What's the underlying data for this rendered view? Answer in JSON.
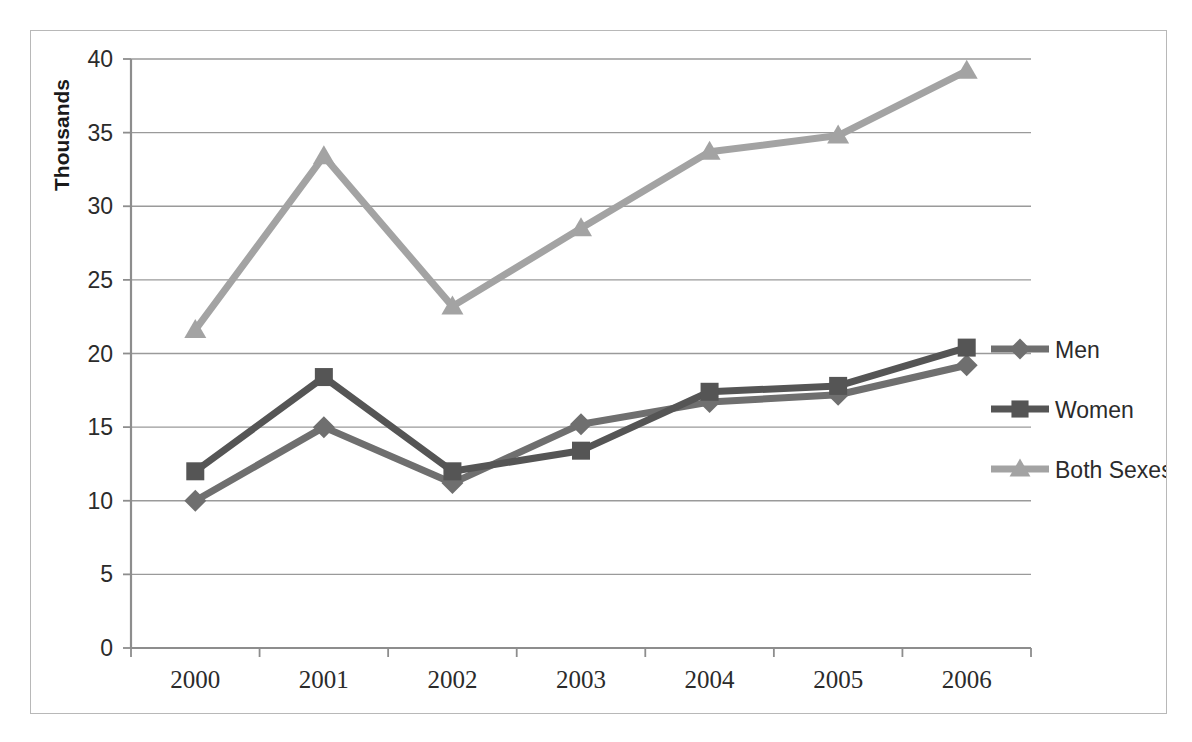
{
  "chart_data": {
    "type": "line",
    "title": "",
    "xlabel": "",
    "ylabel": "Thousands",
    "categories": [
      "2000",
      "2001",
      "2002",
      "2003",
      "2004",
      "2005",
      "2006"
    ],
    "x": [
      2000,
      2001,
      2002,
      2003,
      2004,
      2005,
      2006
    ],
    "series": [
      {
        "name": "Men",
        "marker": "diamond",
        "color": "#6f6f6f",
        "values": [
          10.0,
          15.0,
          11.2,
          15.2,
          16.7,
          17.2,
          19.2
        ]
      },
      {
        "name": "Women",
        "marker": "square",
        "color": "#555555",
        "values": [
          12.0,
          18.4,
          12.0,
          13.4,
          17.4,
          17.8,
          20.4
        ]
      },
      {
        "name": "Both Sexes",
        "marker": "triangle",
        "color": "#a3a3a3",
        "values": [
          21.6,
          33.4,
          23.2,
          28.5,
          33.7,
          34.8,
          39.2
        ]
      }
    ],
    "ylim": [
      0,
      40
    ],
    "yticks": [
      0,
      5,
      10,
      15,
      20,
      25,
      30,
      35,
      40
    ],
    "ytick_labels": [
      "0",
      "5",
      "10",
      "15",
      "20",
      "25",
      "30",
      "35",
      "40"
    ],
    "grid": true,
    "legend_position": "right",
    "plot_background": "#ffffff",
    "border_color": "#b8b8b8",
    "gridline_color": "#9a9a9a"
  },
  "legend": {
    "entries": [
      {
        "label": "Men"
      },
      {
        "label": "Women"
      },
      {
        "label": "Both Sexes"
      }
    ]
  },
  "axis": {
    "y_title": "Thousands"
  }
}
